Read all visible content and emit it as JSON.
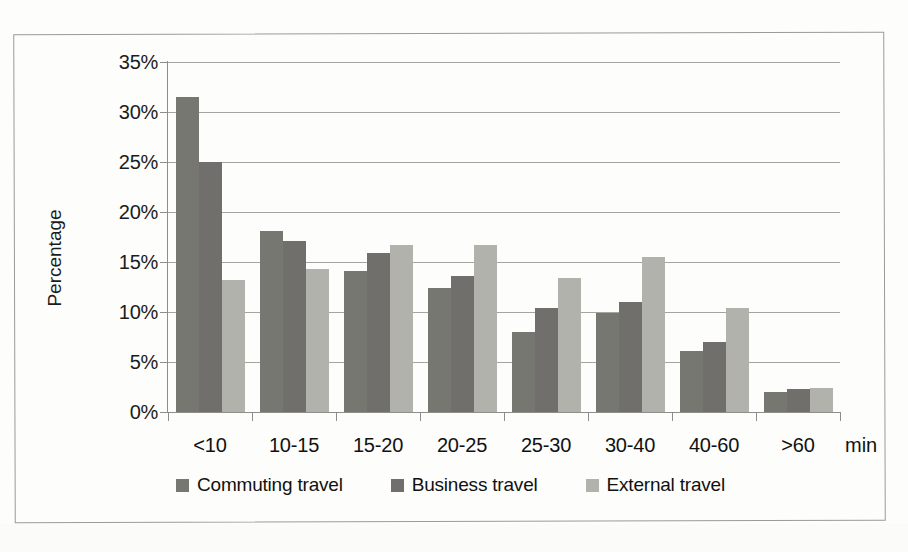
{
  "chart_data": {
    "type": "bar",
    "title": "",
    "subtitle": "",
    "xlabel": "",
    "xunit": "min",
    "ylabel": "Percentage",
    "categories": [
      "<10",
      "10-15",
      "15-20",
      "20-25",
      "25-30",
      "30-40",
      "40-60",
      ">60"
    ],
    "series": [
      {
        "name": "Commuting travel",
        "color": "#777772",
        "values": [
          31.5,
          18.1,
          14.1,
          12.4,
          8.0,
          9.9,
          6.1,
          2.0
        ]
      },
      {
        "name": "Business travel",
        "color": "#706f6b",
        "values": [
          25.0,
          17.1,
          15.9,
          13.6,
          10.4,
          11.0,
          7.0,
          2.3
        ]
      },
      {
        "name": "External travel",
        "color": "#b2b2ad",
        "values": [
          13.2,
          14.3,
          16.7,
          16.7,
          13.4,
          15.5,
          10.4,
          2.4
        ]
      }
    ],
    "ylim": [
      0,
      35
    ],
    "ytick_values": [
      0,
      5,
      10,
      15,
      20,
      25,
      30,
      35
    ],
    "ytick_labels": [
      "0%",
      "5%",
      "10%",
      "15%",
      "20%",
      "25%",
      "30%",
      "35%"
    ],
    "grid": true,
    "legend_position": "bottom"
  },
  "legend": {
    "items": [
      {
        "label": "Commuting travel"
      },
      {
        "label": "Business travel"
      },
      {
        "label": "External travel"
      }
    ]
  },
  "axes": {
    "y_title": "Percentage",
    "x_unit": "min"
  }
}
